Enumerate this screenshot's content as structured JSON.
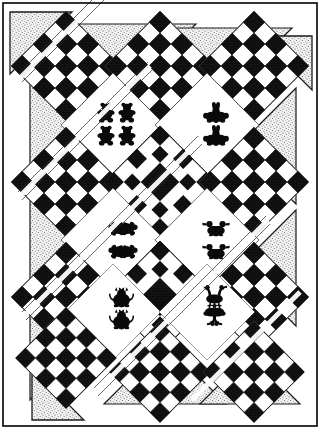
{
  "figure": {
    "title": "Diagonal Set Quilt Pattern Diagram",
    "caption": "Black and white line-art quilt layout diagram",
    "width": 320,
    "height": 429
  },
  "colors": {
    "ink": "#000000",
    "paper": "#ffffff",
    "stipple_fill": "#e8e8e8",
    "stipple_dot": "#505050",
    "patch_dark": "#111111",
    "patch_light": "#ffffff",
    "outline": "#1a1a1a",
    "frame": "#000000"
  },
  "frame": {
    "label": "outer frame border",
    "stroke_width": 1.6,
    "inset": 3
  },
  "layout": {
    "set": "on-point diagonal set",
    "columns": 3,
    "rows": 4,
    "block_size": 78,
    "origin_x": 8,
    "origin_y": 6,
    "rotation_deg": 45,
    "sashing": 4
  },
  "legend": {
    "ninepatch_label": "Nine-patch block",
    "motif_label": "Appliqué motif block",
    "setting_triangle_label": "Setting triangle",
    "corner_triangle_label": "Corner triangle"
  },
  "blocks": [
    {
      "id": "b-0-0",
      "type": "ninepatch",
      "cx": 66,
      "cy": 66,
      "row": 0,
      "col": 0,
      "motif": ""
    },
    {
      "id": "b-0-1",
      "type": "ninepatch",
      "cx": 160,
      "cy": 66,
      "row": 0,
      "col": 1,
      "motif": ""
    },
    {
      "id": "b-0-2",
      "type": "ninepatch",
      "cx": 254,
      "cy": 66,
      "row": 0,
      "col": 2,
      "motif": ""
    },
    {
      "id": "b-1-0",
      "type": "motif",
      "cx": 113,
      "cy": 125,
      "row": 1,
      "col": 0,
      "motif": "bear"
    },
    {
      "id": "b-1-1",
      "type": "motif",
      "cx": 207,
      "cy": 125,
      "row": 1,
      "col": 1,
      "motif": "bunny"
    },
    {
      "id": "b-2-0",
      "type": "ninepatch",
      "cx": 66,
      "cy": 182,
      "row": 2,
      "col": 0,
      "motif": ""
    },
    {
      "id": "b-2-1",
      "type": "ninepatch",
      "cx": 160,
      "cy": 182,
      "row": 2,
      "col": 1,
      "motif": ""
    },
    {
      "id": "b-2-2",
      "type": "ninepatch",
      "cx": 254,
      "cy": 182,
      "row": 2,
      "col": 2,
      "motif": ""
    },
    {
      "id": "b-3-0",
      "type": "motif",
      "cx": 113,
      "cy": 240,
      "row": 3,
      "col": 0,
      "motif": "turtle"
    },
    {
      "id": "b-3-1",
      "type": "motif",
      "cx": 207,
      "cy": 240,
      "row": 3,
      "col": 1,
      "motif": "duck"
    },
    {
      "id": "b-4-0",
      "type": "ninepatch",
      "cx": 66,
      "cy": 297,
      "row": 4,
      "col": 0,
      "motif": ""
    },
    {
      "id": "b-4-1",
      "type": "ninepatch",
      "cx": 160,
      "cy": 297,
      "row": 4,
      "col": 1,
      "motif": ""
    },
    {
      "id": "b-4-2",
      "type": "ninepatch",
      "cx": 254,
      "cy": 297,
      "row": 4,
      "col": 2,
      "motif": ""
    },
    {
      "id": "b-5-0",
      "type": "motif",
      "cx": 113,
      "cy": 312,
      "row": 5,
      "col": 0,
      "motif": "cat"
    },
    {
      "id": "b-5-1",
      "type": "motif",
      "cx": 207,
      "cy": 312,
      "row": 5,
      "col": 1,
      "motif": "goose"
    },
    {
      "id": "b-6-0",
      "type": "ninepatch",
      "cx": 66,
      "cy": 358,
      "row": 6,
      "col": 0,
      "motif": ""
    },
    {
      "id": "b-6-1",
      "type": "ninepatch",
      "cx": 160,
      "cy": 358,
      "row": 6,
      "col": 1,
      "motif": ""
    },
    {
      "id": "b-6-2",
      "type": "ninepatch",
      "cx": 254,
      "cy": 358,
      "row": 6,
      "col": 2,
      "motif": ""
    }
  ],
  "motif_groups": [
    {
      "id": "mg-bear",
      "name": "bear",
      "count": 4,
      "label": "bear appliqué"
    },
    {
      "id": "mg-bunny",
      "name": "bunny",
      "count": 4,
      "label": "bunny appliqué"
    },
    {
      "id": "mg-turtle",
      "name": "turtle",
      "count": 4,
      "label": "turtle appliqué"
    },
    {
      "id": "mg-duck",
      "name": "duck",
      "count": 4,
      "label": "duck appliqué"
    },
    {
      "id": "mg-cat",
      "name": "cat",
      "count": 4,
      "label": "cat appliqué"
    },
    {
      "id": "mg-goose",
      "name": "goose",
      "count": 4,
      "label": "goose appliqué"
    }
  ],
  "corner_triangles": [
    {
      "id": "ct-tl",
      "position": "top-left"
    },
    {
      "id": "ct-tr",
      "position": "top-right"
    },
    {
      "id": "ct-bl",
      "position": "bottom-left"
    }
  ],
  "setting_triangles": {
    "top_count": 2,
    "left_count": 3,
    "right_count": 2,
    "bottom_count": 2
  }
}
